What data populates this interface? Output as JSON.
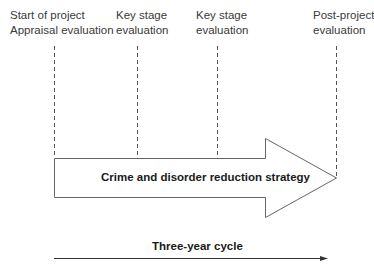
{
  "diagram": {
    "milestones": [
      {
        "line1": "Start of project",
        "line2": "Appraisal evaluation",
        "x": 54
      },
      {
        "line1": "Key stage",
        "line2": "evaluation",
        "x": 137
      },
      {
        "line1": "Key stage",
        "line2": "evaluation",
        "x": 217
      },
      {
        "line1": "Post-project",
        "line2": "evaluation",
        "x": 336
      }
    ],
    "main_arrow_label": "Crime and disorder reduction strategy",
    "timeline_label": "Three-year cycle",
    "colors": {
      "line": "#555555",
      "text": "#3a3a3a",
      "bold_text": "#1a1a1a"
    }
  }
}
